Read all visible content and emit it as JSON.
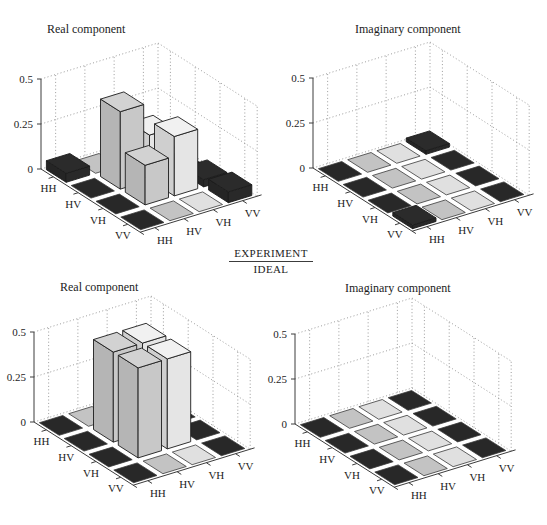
{
  "figure": {
    "divider": {
      "numerator": "EXPERIMENT",
      "denominator": "IDEAL"
    },
    "colors": {
      "background": "#ffffff",
      "series": {
        "HH": "#2b2b2b",
        "HV": "#d2d2d2",
        "VH": "#f1f1f1",
        "VV": "#2b2b2b"
      },
      "edge": "#1c1c1c",
      "tile_edge": "#3a3a3a",
      "grid_dot": "#909090",
      "axis": "#3c3c3c",
      "text": "#1c1c1c"
    }
  },
  "chart_data": [
    {
      "id": "experiment-real",
      "type": "bar",
      "style": "bar3d-matrix",
      "group": "EXPERIMENT",
      "title": "Real component",
      "rows": [
        "HH",
        "HV",
        "VH",
        "VV"
      ],
      "cols": [
        "HH",
        "HV",
        "VH",
        "VV"
      ],
      "zlim": [
        0,
        0.5
      ],
      "z_ticks": [
        {
          "value": 0,
          "label": "0"
        },
        {
          "value": 0.25,
          "label": "0.25"
        },
        {
          "value": 0.5,
          "label": "0.5"
        }
      ],
      "values": [
        [
          0.05,
          0,
          0,
          0
        ],
        [
          0,
          0.43,
          0.25,
          0
        ],
        [
          0,
          0.22,
          0.33,
          0.04
        ],
        [
          0,
          0,
          0,
          0.06
        ]
      ]
    },
    {
      "id": "experiment-imaginary",
      "type": "bar",
      "style": "bar3d-matrix",
      "group": "EXPERIMENT",
      "title": "Imaginary component",
      "rows": [
        "HH",
        "HV",
        "VH",
        "VV"
      ],
      "cols": [
        "HH",
        "HV",
        "VH",
        "VV"
      ],
      "zlim": [
        0,
        0.5
      ],
      "z_ticks": [
        {
          "value": 0,
          "label": "0"
        },
        {
          "value": 0.25,
          "label": "0.25"
        },
        {
          "value": 0.5,
          "label": "0.5"
        }
      ],
      "values": [
        [
          0,
          0,
          0,
          0.02
        ],
        [
          0,
          0,
          0,
          0
        ],
        [
          0,
          0,
          0,
          0
        ],
        [
          0.02,
          0,
          0,
          0
        ]
      ]
    },
    {
      "id": "ideal-real",
      "type": "bar",
      "style": "bar3d-matrix",
      "group": "IDEAL",
      "title": "Real component",
      "rows": [
        "HH",
        "HV",
        "VH",
        "VV"
      ],
      "cols": [
        "HH",
        "HV",
        "VH",
        "VV"
      ],
      "zlim": [
        0,
        0.5
      ],
      "z_ticks": [
        {
          "value": 0,
          "label": "0"
        },
        {
          "value": 0.25,
          "label": "0.25"
        },
        {
          "value": 0.5,
          "label": "0.5"
        }
      ],
      "values": [
        [
          0,
          0,
          0,
          0
        ],
        [
          0,
          0.5,
          0.5,
          0
        ],
        [
          0,
          0.5,
          0.5,
          0
        ],
        [
          0,
          0,
          0,
          0
        ]
      ]
    },
    {
      "id": "ideal-imaginary",
      "type": "bar",
      "style": "bar3d-matrix",
      "group": "IDEAL",
      "title": "Imaginary component",
      "rows": [
        "HH",
        "HV",
        "VH",
        "VV"
      ],
      "cols": [
        "HH",
        "HV",
        "VH",
        "VV"
      ],
      "zlim": [
        0,
        0.5
      ],
      "z_ticks": [
        {
          "value": 0,
          "label": "0"
        },
        {
          "value": 0.25,
          "label": "0.25"
        },
        {
          "value": 0.5,
          "label": "0.5"
        }
      ],
      "values": [
        [
          0,
          0,
          0,
          0
        ],
        [
          0,
          0,
          0,
          0
        ],
        [
          0,
          0,
          0,
          0
        ],
        [
          0,
          0,
          0,
          0
        ]
      ]
    }
  ]
}
